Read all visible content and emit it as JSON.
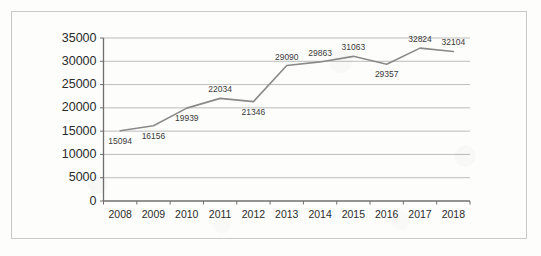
{
  "figure": {
    "border_color": "#c9c9c9",
    "background": "#fdfdfc"
  },
  "chart_data": {
    "type": "line",
    "title": "",
    "subtitle": "",
    "xlabel": "",
    "ylabel": "",
    "categories": [
      "2008",
      "2009",
      "2010",
      "2011",
      "2012",
      "2013",
      "2014",
      "2015",
      "2016",
      "2017",
      "2018"
    ],
    "values": [
      15094,
      16156,
      19939,
      22034,
      21346,
      29090,
      29863,
      31063,
      29357,
      32824,
      32104
    ],
    "point_labels": [
      "15094",
      "16156",
      "19939",
      "22034",
      "21346",
      "29090",
      "29863",
      "31063",
      "29357",
      "32824",
      "32104"
    ],
    "label_positions": [
      "below",
      "below",
      "below",
      "above",
      "below",
      "above",
      "above",
      "above",
      "below",
      "above",
      "above"
    ],
    "ylim": [
      0,
      35000
    ],
    "ytick_values": [
      35000,
      30000,
      25000,
      20000,
      15000,
      10000,
      5000,
      0
    ],
    "ytick_labels": [
      "35000",
      "30000",
      "25000",
      "20000",
      "15000",
      "10000",
      "5000",
      "0"
    ],
    "xtick_labels": [
      "2008",
      "2009",
      "2010",
      "2011",
      "2012",
      "2013",
      "2014",
      "2015",
      "2016",
      "2017",
      "2018"
    ],
    "grid": "horizontal",
    "legend": "none",
    "series": [
      {
        "name": "series-1",
        "color": "#8a8a8a",
        "line_width": 1.6,
        "values": [
          15094,
          16156,
          19939,
          22034,
          21346,
          29090,
          29863,
          31063,
          29357,
          32824,
          32104
        ]
      }
    ],
    "axis_color": "#6f6f6f",
    "grid_color": "#b6b6b6"
  }
}
